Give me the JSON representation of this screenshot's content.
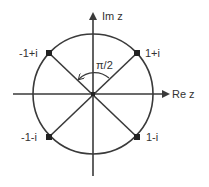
{
  "diagram": {
    "type": "complex-plane-unit-circle",
    "colors": {
      "stroke": "#3a3a3a",
      "text": "#333333",
      "background": "#ffffff"
    },
    "axes": {
      "real_label": "Re z",
      "imaginary_label": "Im z"
    },
    "angle_label": "π/2",
    "points": [
      {
        "label": "1+i",
        "re": 1,
        "im": 1
      },
      {
        "label": "-1+i",
        "re": -1,
        "im": 1
      },
      {
        "label": "-1-i",
        "re": -1,
        "im": -1
      },
      {
        "label": "1-i",
        "re": 1,
        "im": -1
      }
    ]
  }
}
